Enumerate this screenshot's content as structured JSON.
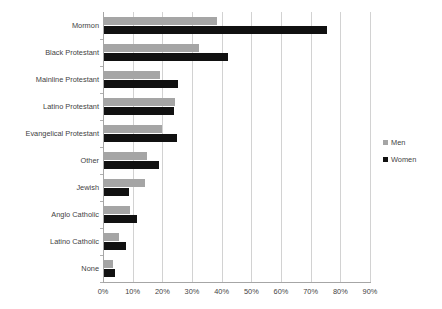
{
  "chart_data": {
    "type": "bar",
    "orientation": "horizontal",
    "title": "",
    "subtitle": "",
    "xlabel": "",
    "ylabel": "",
    "xlim": [
      0,
      90
    ],
    "xtick_labels": [
      "0%",
      "10%",
      "20%",
      "30%",
      "40%",
      "50%",
      "60%",
      "70%",
      "80%",
      "90%"
    ],
    "xtick_values": [
      0,
      10,
      20,
      30,
      40,
      50,
      60,
      70,
      80,
      90
    ],
    "grid": true,
    "grid_axis": "x",
    "legend_position": "right",
    "categories": [
      "Mormon",
      "Black Protestant",
      "Mainline Protestant",
      "Latino Protestant",
      "Evangelical Protestant",
      "Other",
      "Jewish",
      "Anglo Catholic",
      "Latino Catholic",
      "None"
    ],
    "series": [
      {
        "name": "Men",
        "color": "#a5a5a5",
        "values": [
          38.4,
          32.4,
          19.2,
          24.3,
          19.9,
          14.8,
          14.2,
          9.1,
          5.4,
          3.4
        ]
      },
      {
        "name": "Women",
        "color": "#111111",
        "values": [
          75.5,
          42.1,
          25.3,
          23.8,
          24.9,
          18.9,
          8.8,
          11.5,
          7.8,
          4.0
        ]
      }
    ]
  },
  "legend": {
    "entries": [
      {
        "label": "Men",
        "swatch": "men-swatch-icon"
      },
      {
        "label": "Women",
        "swatch": "women-swatch-icon"
      }
    ]
  },
  "colors": {
    "men": "#a5a5a5",
    "women": "#111111",
    "gridline": "#d2d2d2",
    "axis": "#a6a6a6",
    "text": "#3f3f3f",
    "background": "#ffffff"
  }
}
